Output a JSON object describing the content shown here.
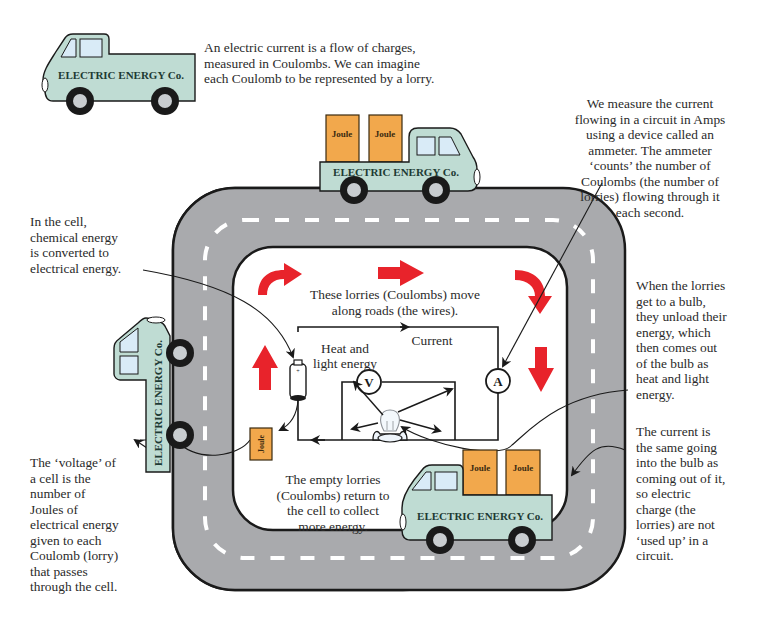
{
  "colors": {
    "road": "#a9aaad",
    "road_edge": "#1a1a1a",
    "lane_marking": "#ffffff",
    "truck_body": "#bfdcd3",
    "truck_window": "#d9ebf7",
    "joule_box": "#f2a84c",
    "arrow_red": "#e8232b",
    "text": "#2a2a2a"
  },
  "truck": {
    "company_label": "ELECTRIC ENERGY Co.",
    "box_label": "Joule"
  },
  "annotations": {
    "intro": {
      "lines": [
        "An electric current is a flow of charges,",
        "measured in Coulombs. We can imagine",
        "each Coulomb to be represented by a lorry."
      ]
    },
    "ammeter": {
      "lines": [
        "We measure the current",
        "flowing in a circuit in Amps",
        "using a device called an",
        "ammeter. The ammeter",
        "‘counts’ the number of",
        "Coulombs (the number of",
        "lorries) flowing through it",
        "each second."
      ]
    },
    "cell": {
      "lines": [
        "In the cell,",
        "chemical energy",
        "is converted to",
        "electrical energy."
      ]
    },
    "bulb": {
      "lines": [
        "When the lorries",
        "get to a bulb,",
        "they unload their",
        "energy, which",
        "then comes out",
        "of the bulb as",
        "heat and light",
        "energy."
      ]
    },
    "voltage": {
      "lines": [
        "The ‘voltage’ of",
        "a cell is the",
        "number of",
        "Joules of",
        "electrical energy",
        "given to each",
        "Coulomb (lorry)",
        "that passes",
        "through the cell."
      ]
    },
    "current_same": {
      "lines": [
        "The current is",
        "the same going",
        "into the bulb as",
        "coming out of it,",
        "so electric",
        "charge (the",
        "lorries) are not",
        "‘used up’ in a",
        "circuit."
      ]
    },
    "roads": {
      "lines": [
        "These lorries (Coulombs) move",
        "along roads (the wires)."
      ]
    },
    "empty_lorries": {
      "lines": [
        "The empty lorries",
        "(Coulombs) return to",
        "the cell to collect",
        "more energy."
      ]
    }
  },
  "circuit": {
    "current_label": "Current",
    "heat_light_lines": [
      "Heat and",
      "light energy"
    ],
    "voltmeter_symbol": "V",
    "ammeter_symbol": "A"
  }
}
